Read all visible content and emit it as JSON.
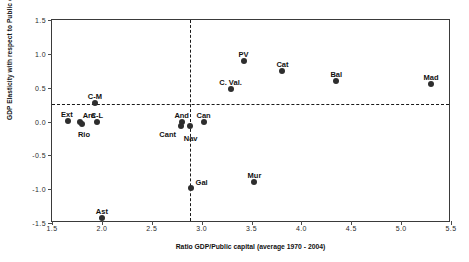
{
  "chart_data": {
    "type": "scatter",
    "title": "",
    "xlabel": "Ratio GDP/Public capital (average 1970 - 2004)",
    "ylabel": "GDP Elasticity with respect to Public capital",
    "xlim": [
      1.5,
      5.5
    ],
    "ylim": [
      -1.5,
      1.5
    ],
    "xticks": [
      "1.5",
      "2.0",
      "2.5",
      "3.0",
      "3.5",
      "4.0",
      "4.5",
      "5.0",
      "5.5"
    ],
    "xtick_values": [
      1.5,
      2.0,
      2.5,
      3.0,
      3.5,
      4.0,
      4.5,
      5.0,
      5.5
    ],
    "yticks": [
      "1.5",
      "1.0",
      "0.5",
      "0.0",
      "-0.5",
      "-1.0",
      "-1.5"
    ],
    "ytick_values": [
      1.5,
      1.0,
      0.5,
      0.0,
      -0.5,
      -1.0,
      -1.5
    ],
    "grid": false,
    "legend": "none",
    "reference_lines": {
      "horizontal_y": 0.26,
      "vertical_x": 2.88,
      "style": "dashed"
    },
    "marker_color": "#2e2e2e",
    "points": [
      {
        "label": "Ext",
        "x": 1.66,
        "y": 0.01,
        "label_dx": -1,
        "label_dy": -11
      },
      {
        "label": "Ara",
        "x": 1.78,
        "y": 0.0,
        "label_dx": 9,
        "label_dy": -11
      },
      {
        "label": "Rio",
        "x": 1.8,
        "y": -0.03,
        "label_dx": 2,
        "label_dy": 6
      },
      {
        "label": "C-L",
        "x": 1.95,
        "y": 0.0,
        "label_dx": 0,
        "label_dy": -11
      },
      {
        "label": "C-M",
        "x": 1.93,
        "y": 0.27,
        "label_dx": 0,
        "label_dy": -11
      },
      {
        "label": "Ast",
        "x": 2.0,
        "y": -1.43,
        "label_dx": 0,
        "label_dy": -11
      },
      {
        "label": "And",
        "x": 2.8,
        "y": 0.0,
        "label_dx": 0,
        "label_dy": -11
      },
      {
        "label": "Cant",
        "x": 2.79,
        "y": -0.06,
        "label_dx": -13,
        "label_dy": 4
      },
      {
        "label": "Nav",
        "x": 2.88,
        "y": -0.07,
        "label_dx": 1,
        "label_dy": 8
      },
      {
        "label": "Gal",
        "x": 2.89,
        "y": -0.99,
        "label_dx": 11,
        "label_dy": -10
      },
      {
        "label": "Can",
        "x": 3.02,
        "y": 0.0,
        "label_dx": 0,
        "label_dy": -11
      },
      {
        "label": "C. Val.",
        "x": 3.29,
        "y": 0.48,
        "label_dx": 0,
        "label_dy": -11
      },
      {
        "label": "PV",
        "x": 3.42,
        "y": 0.9,
        "label_dx": 0,
        "label_dy": -11
      },
      {
        "label": "Mur",
        "x": 3.53,
        "y": -0.9,
        "label_dx": 0,
        "label_dy": -11
      },
      {
        "label": "Cat",
        "x": 3.81,
        "y": 0.74,
        "label_dx": 0,
        "label_dy": -11
      },
      {
        "label": "Bal",
        "x": 4.35,
        "y": 0.6,
        "label_dx": 0,
        "label_dy": -11
      },
      {
        "label": "Mad",
        "x": 5.3,
        "y": 0.56,
        "label_dx": 0,
        "label_dy": -11
      }
    ]
  }
}
